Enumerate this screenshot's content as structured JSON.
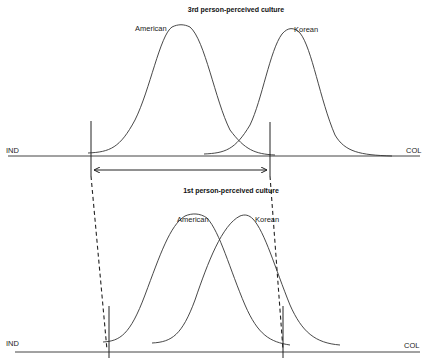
{
  "top_panel": {
    "title": "3rd person-perceived culture",
    "axis_left_label": "IND",
    "axis_right_label": "COL",
    "curves": [
      {
        "label": "American"
      },
      {
        "label": "Korean"
      }
    ]
  },
  "bottom_panel": {
    "title": "1st person-perceived culture",
    "axis_left_label": "IND",
    "axis_right_label": "COL",
    "curves": [
      {
        "label": "American"
      },
      {
        "label": "Korean"
      }
    ]
  }
}
